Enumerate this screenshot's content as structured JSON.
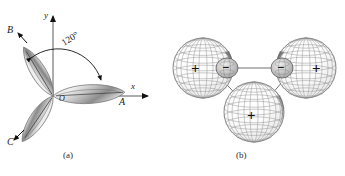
{
  "figure": {
    "domain_type": "diagram",
    "background_color": "#ffffff",
    "ink_color": "#1a1a1a"
  },
  "panel_a": {
    "caption": "(a)",
    "origin_label": "O",
    "axes": {
      "y_label": "y",
      "x_label": "x"
    },
    "angle_annotation": {
      "text": "120°",
      "value": 120,
      "unit": "degrees"
    },
    "lobes": [
      {
        "label": "A",
        "direction_deg": 0,
        "name": "lobe-a-right"
      },
      {
        "label": "B",
        "direction_deg": 120,
        "name": "lobe-b-upper-left"
      },
      {
        "label": "C",
        "direction_deg": 240,
        "name": "lobe-c-lower-left"
      }
    ],
    "lobe_fill_light": "#e8e8e8",
    "lobe_fill_dark": "#8e8e8e"
  },
  "panel_b": {
    "caption": "(b)",
    "spheres": [
      {
        "sign": "+",
        "position": "left",
        "size": "large",
        "name": "sphere-left-positive"
      },
      {
        "sign": "+",
        "position": "right",
        "size": "large",
        "name": "sphere-right-positive"
      },
      {
        "sign": "+",
        "position": "bottom",
        "size": "large",
        "name": "sphere-bottom-positive"
      }
    ],
    "small_lobes": [
      {
        "sign": "−",
        "position": "left-inner",
        "name": "lobe-left-negative"
      },
      {
        "sign": "−",
        "position": "right-inner",
        "name": "lobe-right-negative"
      }
    ],
    "mesh_color": "#777777",
    "shade_color": "#4a4a4a"
  }
}
